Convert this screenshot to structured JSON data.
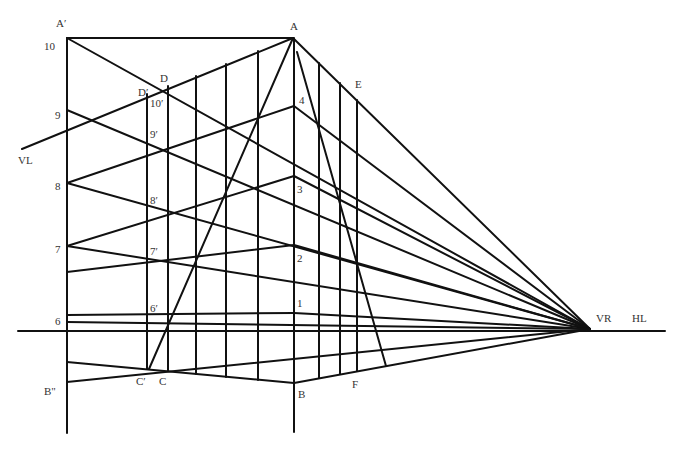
{
  "diagram": {
    "type": "two-point perspective construction",
    "colors": {
      "line": "#111111",
      "label": "#333333",
      "background": "#ffffff"
    },
    "points": {
      "A_prime": {
        "label": "A′",
        "x": 67,
        "y": 38
      },
      "A": {
        "label": "A",
        "x": 293,
        "y": 38
      },
      "B": {
        "label": "B",
        "x": 294,
        "y": 383
      },
      "B_dbl": {
        "label": "B\"",
        "x": 67,
        "y": 382
      },
      "C_prime": {
        "label": "C′",
        "x": 149,
        "y": 369
      },
      "C": {
        "label": "C",
        "x": 168,
        "y": 371
      },
      "D_prime": {
        "label": "D′",
        "x": 147,
        "y": 94
      },
      "D": {
        "label": "D",
        "x": 168,
        "y": 86
      },
      "E": {
        "label": "E",
        "x": 357,
        "y": 92
      },
      "F": {
        "label": "F",
        "x": 357,
        "y": 374
      },
      "VR": {
        "label": "VR",
        "x": 590,
        "y": 329
      },
      "VL": {
        "label": "VL",
        "x": 22,
        "y": 149
      }
    },
    "labels": [
      {
        "id": "A_prime",
        "text": "A′",
        "x": 56,
        "y": 27
      },
      {
        "id": "A",
        "text": "A",
        "x": 290,
        "y": 30
      },
      {
        "id": "n10",
        "text": "10",
        "x": 44,
        "y": 50
      },
      {
        "id": "n9",
        "text": "9",
        "x": 55,
        "y": 119
      },
      {
        "id": "n8",
        "text": "8",
        "x": 55,
        "y": 190
      },
      {
        "id": "n7",
        "text": "7",
        "x": 55,
        "y": 253
      },
      {
        "id": "n6",
        "text": "6",
        "x": 55,
        "y": 325
      },
      {
        "id": "VL",
        "text": "VL",
        "x": 18,
        "y": 164
      },
      {
        "id": "B_dbl",
        "text": "B\"",
        "x": 44,
        "y": 395
      },
      {
        "id": "D",
        "text": "D",
        "x": 160,
        "y": 82
      },
      {
        "id": "D_prime",
        "text": "D′",
        "x": 138,
        "y": 96
      },
      {
        "id": "n10p",
        "text": "10′",
        "x": 150,
        "y": 107
      },
      {
        "id": "n9p",
        "text": "9′",
        "x": 150,
        "y": 138
      },
      {
        "id": "n8p",
        "text": "8′",
        "x": 150,
        "y": 204
      },
      {
        "id": "n7p",
        "text": "7′",
        "x": 150,
        "y": 255
      },
      {
        "id": "n6p",
        "text": "6′",
        "x": 150,
        "y": 312
      },
      {
        "id": "C_prime",
        "text": "C′",
        "x": 136,
        "y": 385
      },
      {
        "id": "C",
        "text": "C",
        "x": 159,
        "y": 385
      },
      {
        "id": "E",
        "text": "E",
        "x": 355,
        "y": 88
      },
      {
        "id": "n4",
        "text": "4",
        "x": 299,
        "y": 104
      },
      {
        "id": "n3",
        "text": "3",
        "x": 297,
        "y": 193
      },
      {
        "id": "n2",
        "text": "2",
        "x": 297,
        "y": 262
      },
      {
        "id": "n1",
        "text": "1",
        "x": 297,
        "y": 307
      },
      {
        "id": "B",
        "text": "B",
        "x": 298,
        "y": 398
      },
      {
        "id": "F",
        "text": "F",
        "x": 352,
        "y": 388
      },
      {
        "id": "VR",
        "text": "VR",
        "x": 596,
        "y": 322
      },
      {
        "id": "HL",
        "text": "HL",
        "x": 632,
        "y": 322
      }
    ],
    "lines": [
      {
        "id": "horizon",
        "x1": 18,
        "y1": 331,
        "x2": 665,
        "y2": 331
      },
      {
        "id": "left-vertical",
        "x1": 67,
        "y1": 38,
        "x2": 67,
        "y2": 433
      },
      {
        "id": "center-vertical",
        "x1": 294,
        "y1": 38,
        "x2": 294,
        "y2": 432
      },
      {
        "id": "top-edge",
        "x1": 67,
        "y1": 38,
        "x2": 293,
        "y2": 38
      },
      {
        "id": "vl-line",
        "x1": 22,
        "y1": 149,
        "x2": 293,
        "y2": 38
      },
      {
        "id": "a-to-vr",
        "x1": 293,
        "y1": 38,
        "x2": 590,
        "y2": 329
      },
      {
        "id": "a-to-c",
        "x1": 293,
        "y1": 38,
        "x2": 149,
        "y2": 369
      },
      {
        "id": "a-to-f",
        "x1": 297,
        "y1": 52,
        "x2": 386,
        "y2": 366
      },
      {
        "id": "a-prime-diag",
        "x1": 67,
        "y1": 38,
        "x2": 590,
        "y2": 329
      },
      {
        "id": "n9-to-vr",
        "x1": 67,
        "y1": 110,
        "x2": 590,
        "y2": 329
      },
      {
        "id": "n8-to-4",
        "x1": 67,
        "y1": 183,
        "x2": 294,
        "y2": 106
      },
      {
        "id": "4-to-vr",
        "x1": 294,
        "y1": 106,
        "x2": 590,
        "y2": 329
      },
      {
        "id": "n8-to-vr",
        "x1": 67,
        "y1": 183,
        "x2": 590,
        "y2": 329
      },
      {
        "id": "n7-to-3",
        "x1": 67,
        "y1": 246,
        "x2": 294,
        "y2": 176
      },
      {
        "id": "3-to-vr",
        "x1": 294,
        "y1": 176,
        "x2": 590,
        "y2": 329
      },
      {
        "id": "n7-to-vr",
        "x1": 67,
        "y1": 246,
        "x2": 590,
        "y2": 329
      },
      {
        "id": "low7-to-2",
        "x1": 67,
        "y1": 272,
        "x2": 294,
        "y2": 245
      },
      {
        "id": "2-to-vr",
        "x1": 294,
        "y1": 245,
        "x2": 590,
        "y2": 329
      },
      {
        "id": "n6-to-1",
        "x1": 67,
        "y1": 315,
        "x2": 294,
        "y2": 313
      },
      {
        "id": "1-to-vr",
        "x1": 294,
        "y1": 313,
        "x2": 590,
        "y2": 329
      },
      {
        "id": "n6-to-vr",
        "x1": 67,
        "y1": 322,
        "x2": 590,
        "y2": 329
      },
      {
        "id": "upper-base-to-b",
        "x1": 67,
        "y1": 362,
        "x2": 294,
        "y2": 383
      },
      {
        "id": "b-to-vr",
        "x1": 294,
        "y1": 383,
        "x2": 590,
        "y2": 329
      },
      {
        "id": "b-dbl-to-vr",
        "x1": 67,
        "y1": 382,
        "x2": 590,
        "y2": 329
      },
      {
        "id": "v-d-prime",
        "x1": 147,
        "y1": 94,
        "x2": 147,
        "y2": 369
      },
      {
        "id": "v-d",
        "x1": 168,
        "y1": 86,
        "x2": 168,
        "y2": 371
      },
      {
        "id": "v-3",
        "x1": 196,
        "y1": 76,
        "x2": 196,
        "y2": 374
      },
      {
        "id": "v-4",
        "x1": 226,
        "y1": 64,
        "x2": 226,
        "y2": 377
      },
      {
        "id": "v-5",
        "x1": 258,
        "y1": 51,
        "x2": 258,
        "y2": 380
      },
      {
        "id": "v-r1",
        "x1": 319,
        "y1": 63,
        "x2": 319,
        "y2": 378
      },
      {
        "id": "v-r2",
        "x1": 340,
        "y1": 83,
        "x2": 340,
        "y2": 374
      },
      {
        "id": "v-e",
        "x1": 357,
        "y1": 100,
        "x2": 357,
        "y2": 371
      }
    ]
  }
}
